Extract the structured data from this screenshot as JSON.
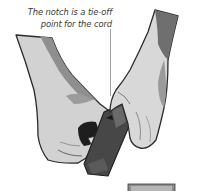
{
  "illustration": {
    "subject": "two hands holding a knife handle at the notch",
    "callout": {
      "lines": [
        "The notch is a tie-off",
        "point for the cord"
      ]
    },
    "colors": {
      "outline": "#2b2b2b",
      "skin_light": "#d6d6d6",
      "skin_mid": "#a9a9a9",
      "skin_shadow": "#7c7c7c",
      "tool_dark": "#3c3c3c",
      "blade": "#e2e2e2",
      "text": "#3a3a3a",
      "leader_line": "#8a8a8a"
    },
    "next_panel_hint": "partial grey panel at bottom right"
  }
}
